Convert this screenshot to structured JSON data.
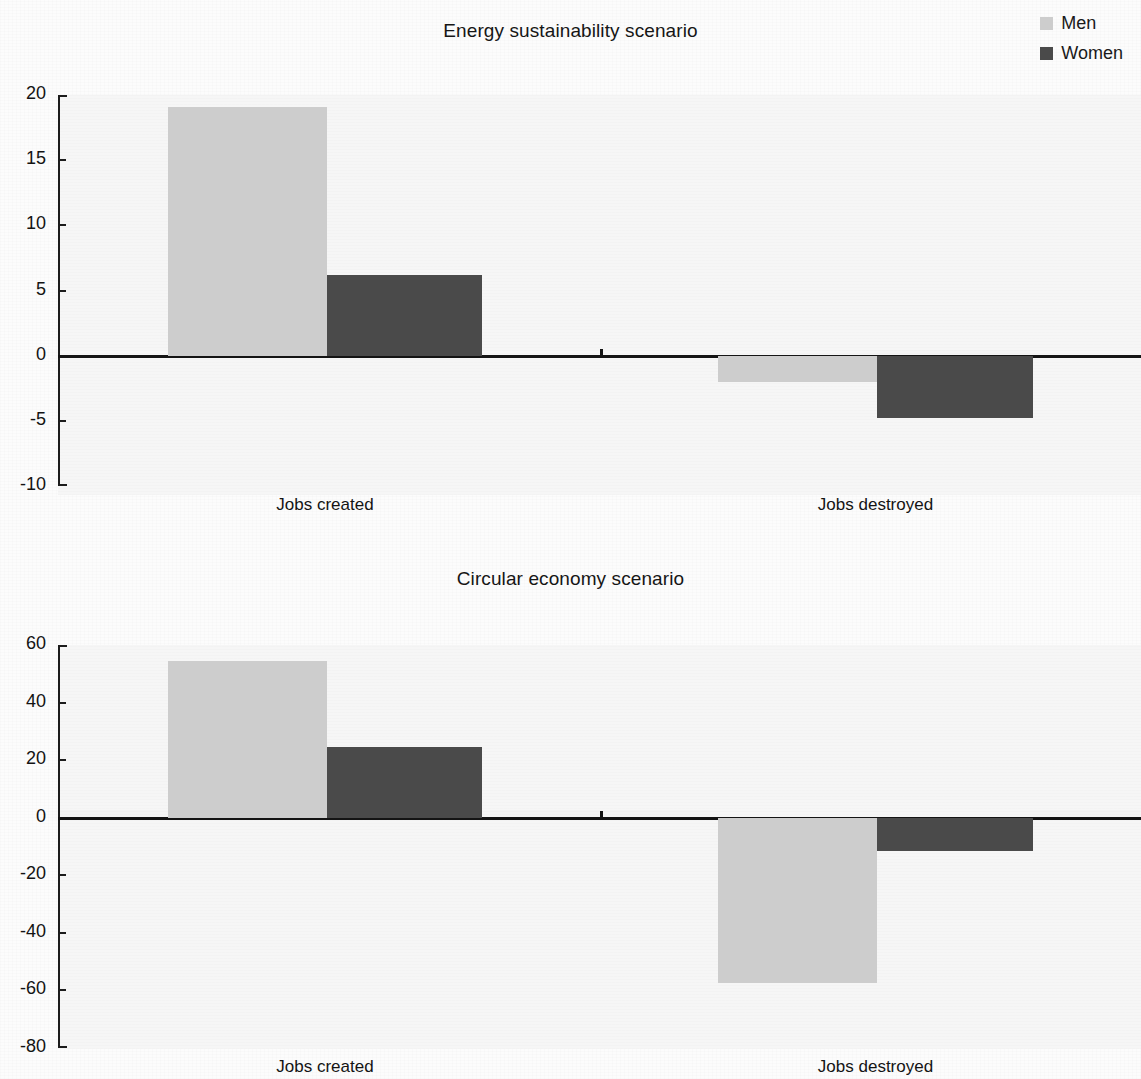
{
  "legend": {
    "items": [
      {
        "label": "Men",
        "color": "#cdcdcd",
        "key": "men"
      },
      {
        "label": "Women",
        "color": "#4a4a4a",
        "key": "women"
      }
    ]
  },
  "charts": [
    {
      "id": "energy-sustainability",
      "title": "Energy sustainability scenario",
      "y_ticks": [
        "20",
        "15",
        "10",
        "5",
        "0",
        "-5",
        "-10"
      ],
      "categories": [
        "Jobs created",
        "Jobs destroyed"
      ]
    },
    {
      "id": "circular-economy",
      "title": "Circular economy scenario",
      "y_ticks": [
        "60",
        "40",
        "20",
        "0",
        "-20",
        "-40",
        "-60",
        "-80"
      ],
      "categories": [
        "Jobs created",
        "Jobs destroyed"
      ]
    }
  ],
  "chart_data": [
    {
      "type": "bar",
      "title": "Energy sustainability scenario",
      "xlabel": "",
      "ylabel": "",
      "categories": [
        "Jobs created",
        "Jobs destroyed"
      ],
      "series": [
        {
          "name": "Men",
          "color": "#cdcdcd",
          "values": [
            19.1,
            -2.0
          ]
        },
        {
          "name": "Women",
          "color": "#4a4a4a",
          "values": [
            6.2,
            -4.8
          ]
        }
      ],
      "ylim": [
        -10,
        20
      ],
      "yticks": [
        20,
        15,
        10,
        5,
        0,
        -5,
        -10
      ],
      "grid": false,
      "legend_position": "top-right"
    },
    {
      "type": "bar",
      "title": "Circular economy scenario",
      "xlabel": "",
      "ylabel": "",
      "categories": [
        "Jobs created",
        "Jobs destroyed"
      ],
      "series": [
        {
          "name": "Men",
          "color": "#cdcdcd",
          "values": [
            54.5,
            -57.5
          ]
        },
        {
          "name": "Women",
          "color": "#4a4a4a",
          "values": [
            24.5,
            -11.5
          ]
        }
      ],
      "ylim": [
        -80,
        60
      ],
      "yticks": [
        60,
        40,
        20,
        0,
        -20,
        -40,
        -60,
        -80
      ],
      "grid": false,
      "legend_position": "top-right"
    }
  ]
}
